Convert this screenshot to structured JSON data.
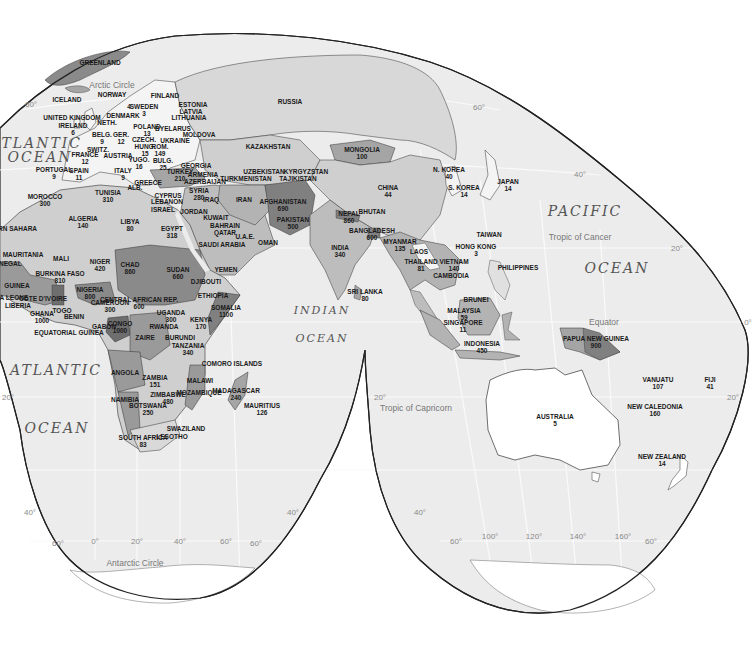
{
  "map": {
    "projection": "Interrupted equal-area (Eurasia/Africa/Oceania lobes)",
    "oceans": [
      {
        "id": "atlantic-n-1",
        "text": "ATLANTIC",
        "x": 36,
        "y": 143,
        "size": "big"
      },
      {
        "id": "atlantic-n-2",
        "text": "OCEAN",
        "x": 40,
        "y": 157,
        "size": "big"
      },
      {
        "id": "atlantic-s-1",
        "text": "ATLANTIC",
        "x": 56,
        "y": 370,
        "size": "big"
      },
      {
        "id": "atlantic-s-2",
        "text": "OCEAN",
        "x": 57,
        "y": 428,
        "size": "big"
      },
      {
        "id": "indian-1",
        "text": "INDIAN",
        "x": 322,
        "y": 310,
        "size": "med"
      },
      {
        "id": "indian-2",
        "text": "OCEAN",
        "x": 322,
        "y": 338,
        "size": "med"
      },
      {
        "id": "pacific-1",
        "text": "PACIFIC",
        "x": 585,
        "y": 211,
        "size": "big"
      },
      {
        "id": "pacific-2",
        "text": "OCEAN",
        "x": 617,
        "y": 268,
        "size": "big"
      }
    ],
    "reference_lines": [
      {
        "id": "arctic-circle",
        "text": "Arctic Circle",
        "x": 112,
        "y": 85
      },
      {
        "id": "tropic-cancer",
        "text": "Tropic of Cancer",
        "x": 580,
        "y": 237
      },
      {
        "id": "equator",
        "text": "Equator",
        "x": 604,
        "y": 322
      },
      {
        "id": "tropic-capricorn",
        "text": "Tropic of Capricorn",
        "x": 416,
        "y": 408
      },
      {
        "id": "antarctic-circle",
        "text": "Antarctic Circle",
        "x": 135,
        "y": 563
      }
    ],
    "graticule_labels": [
      {
        "text": "60°",
        "x": 31,
        "y": 104
      },
      {
        "text": "60°",
        "x": 479,
        "y": 107
      },
      {
        "text": "40°",
        "x": 580,
        "y": 174
      },
      {
        "text": "20°",
        "x": 677,
        "y": 248
      },
      {
        "text": "0°",
        "x": 748,
        "y": 322
      },
      {
        "text": "20°",
        "x": 733,
        "y": 397
      },
      {
        "text": "20°",
        "x": 8,
        "y": 397
      },
      {
        "text": "20°",
        "x": 380,
        "y": 397
      },
      {
        "text": "40°",
        "x": 30,
        "y": 512
      },
      {
        "text": "40°",
        "x": 293,
        "y": 512
      },
      {
        "text": "40°",
        "x": 420,
        "y": 512
      },
      {
        "text": "60°",
        "x": 58,
        "y": 543
      },
      {
        "text": "0°",
        "x": 95,
        "y": 541
      },
      {
        "text": "20°",
        "x": 137,
        "y": 541
      },
      {
        "text": "40°",
        "x": 180,
        "y": 541
      },
      {
        "text": "60°",
        "x": 226,
        "y": 541
      },
      {
        "text": "60°",
        "x": 256,
        "y": 543
      },
      {
        "text": "60°",
        "x": 456,
        "y": 541
      },
      {
        "text": "100°",
        "x": 490,
        "y": 536
      },
      {
        "text": "120°",
        "x": 534,
        "y": 536
      },
      {
        "text": "140°",
        "x": 578,
        "y": 536
      },
      {
        "text": "160°",
        "x": 623,
        "y": 536
      },
      {
        "text": "60°",
        "x": 651,
        "y": 541
      }
    ],
    "countries": [
      {
        "name": "GREENLAND",
        "value": "",
        "x": 100,
        "y": 62
      },
      {
        "name": "ICELAND",
        "value": "",
        "x": 67,
        "y": 99
      },
      {
        "name": "NORWAY",
        "value": "",
        "x": 112,
        "y": 94
      },
      {
        "name": "FINLAND",
        "value": "",
        "x": 165,
        "y": 95
      },
      {
        "name": "SWEDEN",
        "value": "3",
        "x": 144,
        "y": 110
      },
      {
        "name": "",
        "value": "4",
        "x": 129,
        "y": 103
      },
      {
        "name": "ESTONIA",
        "value": "",
        "x": 193,
        "y": 104
      },
      {
        "name": "LATVIA",
        "value": "",
        "x": 191,
        "y": 111
      },
      {
        "name": "LITHUANIA",
        "value": "",
        "x": 189,
        "y": 117
      },
      {
        "name": "UNITED KINGDOM",
        "value": "",
        "x": 72,
        "y": 117
      },
      {
        "name": "DENMARK",
        "value": "",
        "x": 123,
        "y": 115
      },
      {
        "name": "NETH.",
        "value": "",
        "x": 107,
        "y": 122
      },
      {
        "name": "IRELAND",
        "value": "6",
        "x": 73,
        "y": 129
      },
      {
        "name": "POLAND",
        "value": "13",
        "x": 147,
        "y": 130
      },
      {
        "name": "BYELARUS",
        "value": "",
        "x": 173,
        "y": 128
      },
      {
        "name": "MOLDOVA",
        "value": "",
        "x": 199,
        "y": 134
      },
      {
        "name": "BELG.",
        "value": "9",
        "x": 102,
        "y": 138
      },
      {
        "name": "GER.",
        "value": "12",
        "x": 121,
        "y": 138
      },
      {
        "name": "CZECH.",
        "value": "",
        "x": 144,
        "y": 139
      },
      {
        "name": "UKRAINE",
        "value": "",
        "x": 175,
        "y": 140
      },
      {
        "name": "SWITZ.",
        "value": "",
        "x": 98,
        "y": 149
      },
      {
        "name": "AUSTRIA",
        "value": "",
        "x": 118,
        "y": 155
      },
      {
        "name": "HUNG.",
        "value": "15",
        "x": 145,
        "y": 150
      },
      {
        "name": "ROM.",
        "value": "149",
        "x": 160,
        "y": 150
      },
      {
        "name": "FRANCE",
        "value": "12",
        "x": 85,
        "y": 158
      },
      {
        "name": "YUGO.",
        "value": "16",
        "x": 139,
        "y": 163
      },
      {
        "name": "BULG.",
        "value": "25",
        "x": 163,
        "y": 164
      },
      {
        "name": "GEORGIA",
        "value": "",
        "x": 196,
        "y": 165
      },
      {
        "name": "PORTUGAL",
        "value": "9",
        "x": 54,
        "y": 173
      },
      {
        "name": "SPAIN",
        "value": "11",
        "x": 79,
        "y": 174
      },
      {
        "name": "ITALY",
        "value": "9",
        "x": 123,
        "y": 174
      },
      {
        "name": "GREECE",
        "value": "",
        "x": 148,
        "y": 182
      },
      {
        "name": "ALB.",
        "value": "",
        "x": 135,
        "y": 187
      },
      {
        "name": "TURKEY",
        "value": "210",
        "x": 180,
        "y": 175
      },
      {
        "name": "ARMENIA",
        "value": "",
        "x": 203,
        "y": 174
      },
      {
        "name": "AZERBAIJAN",
        "value": "",
        "x": 205,
        "y": 181
      },
      {
        "name": "RUSSIA",
        "value": "",
        "x": 290,
        "y": 101
      },
      {
        "name": "KAZAKHSTAN",
        "value": "",
        "x": 268,
        "y": 146
      },
      {
        "name": "MONGOLIA",
        "value": "100",
        "x": 362,
        "y": 153
      },
      {
        "name": "UZBEKISTAN",
        "value": "",
        "x": 264,
        "y": 171
      },
      {
        "name": "TURKMENISTAN",
        "value": "",
        "x": 246,
        "y": 178
      },
      {
        "name": "KYRGYZSTAN",
        "value": "",
        "x": 306,
        "y": 171
      },
      {
        "name": "TAJIKISTAN",
        "value": "",
        "x": 298,
        "y": 178
      },
      {
        "name": "CHINA",
        "value": "44",
        "x": 388,
        "y": 191
      },
      {
        "name": "N. KOREA",
        "value": "40",
        "x": 449,
        "y": 173
      },
      {
        "name": "S. KOREA",
        "value": "14",
        "x": 464,
        "y": 191
      },
      {
        "name": "JAPAN",
        "value": "14",
        "x": 508,
        "y": 185
      },
      {
        "name": "CYPRUS",
        "value": "",
        "x": 168,
        "y": 195
      },
      {
        "name": "LEBANON",
        "value": "",
        "x": 167,
        "y": 201
      },
      {
        "name": "SYRIA",
        "value": "280",
        "x": 199,
        "y": 194
      },
      {
        "name": "ISRAEL",
        "value": "",
        "x": 163,
        "y": 209
      },
      {
        "name": "JORDAN",
        "value": "",
        "x": 194,
        "y": 211
      },
      {
        "name": "IRAQ",
        "value": "",
        "x": 211,
        "y": 199
      },
      {
        "name": "IRAN",
        "value": "",
        "x": 244,
        "y": 199
      },
      {
        "name": "AFGHANISTAN",
        "value": "690",
        "x": 283,
        "y": 205
      },
      {
        "name": "PAKISTAN",
        "value": "500",
        "x": 293,
        "y": 223
      },
      {
        "name": "KUWAIT",
        "value": "",
        "x": 216,
        "y": 217
      },
      {
        "name": "BAHRAIN",
        "value": "",
        "x": 225,
        "y": 225
      },
      {
        "name": "QATAR",
        "value": "",
        "x": 225,
        "y": 232
      },
      {
        "name": "U.A.E.",
        "value": "",
        "x": 245,
        "y": 236
      },
      {
        "name": "OMAN",
        "value": "",
        "x": 268,
        "y": 242
      },
      {
        "name": "SAUDI ARABIA",
        "value": "",
        "x": 222,
        "y": 244
      },
      {
        "name": "YEMEN",
        "value": "",
        "x": 226,
        "y": 269
      },
      {
        "name": "NEPAL",
        "value": "860",
        "x": 349,
        "y": 217
      },
      {
        "name": "BHUTAN",
        "value": "",
        "x": 372,
        "y": 211
      },
      {
        "name": "BANGLADESH",
        "value": "600",
        "x": 372,
        "y": 234
      },
      {
        "name": "INDIA",
        "value": "340",
        "x": 340,
        "y": 251
      },
      {
        "name": "SRI LANKA",
        "value": "80",
        "x": 365,
        "y": 295
      },
      {
        "name": "MYANMAR",
        "value": "135",
        "x": 400,
        "y": 245
      },
      {
        "name": "LAOS",
        "value": "",
        "x": 419,
        "y": 251
      },
      {
        "name": "THAILAND",
        "value": "81",
        "x": 421,
        "y": 265
      },
      {
        "name": "VIETNAM",
        "value": "140",
        "x": 454,
        "y": 265
      },
      {
        "name": "CAMBODIA",
        "value": "",
        "x": 451,
        "y": 275
      },
      {
        "name": "TAIWAN",
        "value": "",
        "x": 489,
        "y": 234
      },
      {
        "name": "HONG KONG",
        "value": "3",
        "x": 476,
        "y": 250
      },
      {
        "name": "PHILIPPINES",
        "value": "",
        "x": 518,
        "y": 267
      },
      {
        "name": "BRUNEI",
        "value": "",
        "x": 476,
        "y": 299
      },
      {
        "name": "MALAYSIA",
        "value": "59",
        "x": 464,
        "y": 314
      },
      {
        "name": "SINGAPORE",
        "value": "11",
        "x": 463,
        "y": 326
      },
      {
        "name": "INDONESIA",
        "value": "450",
        "x": 482,
        "y": 347
      },
      {
        "name": "PAPUA NEW GUINEA",
        "value": "900",
        "x": 596,
        "y": 342
      },
      {
        "name": "AUSTRALIA",
        "value": "5",
        "x": 555,
        "y": 420
      },
      {
        "name": "VANUATU",
        "value": "107",
        "x": 658,
        "y": 383
      },
      {
        "name": "FIJI",
        "value": "41",
        "x": 710,
        "y": 383
      },
      {
        "name": "NEW CALEDONIA",
        "value": "160",
        "x": 655,
        "y": 410
      },
      {
        "name": "NEW ZEALAND",
        "value": "14",
        "x": 662,
        "y": 460
      },
      {
        "name": "MOROCCO",
        "value": "300",
        "x": 45,
        "y": 200
      },
      {
        "name": "WESTERN SAHARA",
        "value": "",
        "x": 6,
        "y": 228
      },
      {
        "name": "TUNISIA",
        "value": "310",
        "x": 108,
        "y": 196
      },
      {
        "name": "ALGERIA",
        "value": "140",
        "x": 83,
        "y": 222
      },
      {
        "name": "LIBYA",
        "value": "80",
        "x": 130,
        "y": 225
      },
      {
        "name": "EGYPT",
        "value": "318",
        "x": 172,
        "y": 232
      },
      {
        "name": "MAURITANIA",
        "value": "",
        "x": 23,
        "y": 254
      },
      {
        "name": "MALI",
        "value": "",
        "x": 61,
        "y": 258
      },
      {
        "name": "NIGER",
        "value": "420",
        "x": 100,
        "y": 265
      },
      {
        "name": "CHAD",
        "value": "860",
        "x": 130,
        "y": 268
      },
      {
        "name": "SUDAN",
        "value": "660",
        "x": 178,
        "y": 273
      },
      {
        "name": "DJIBOUTI",
        "value": "",
        "x": 206,
        "y": 281
      },
      {
        "name": "ETHIOPIA",
        "value": "",
        "x": 213,
        "y": 295
      },
      {
        "name": "SOMALIA",
        "value": "1100",
        "x": 226,
        "y": 311
      },
      {
        "name": "SENEGAL",
        "value": "",
        "x": 6,
        "y": 263
      },
      {
        "name": "GUINEA",
        "value": "",
        "x": 17,
        "y": 285
      },
      {
        "name": "SIERRA LEONE",
        "value": "",
        "x": 4,
        "y": 297
      },
      {
        "name": "LIBERIA",
        "value": "",
        "x": 18,
        "y": 305
      },
      {
        "name": "BURKINA FASO",
        "value": "810",
        "x": 60,
        "y": 277
      },
      {
        "name": "COTE D'IVOIRE",
        "value": "",
        "x": 43,
        "y": 298
      },
      {
        "name": "NIGERIA",
        "value": "800",
        "x": 90,
        "y": 293
      },
      {
        "name": "GHANA",
        "value": "1000",
        "x": 42,
        "y": 317
      },
      {
        "name": "TOGO",
        "value": "",
        "x": 62,
        "y": 310
      },
      {
        "name": "BENIN",
        "value": "",
        "x": 74,
        "y": 316
      },
      {
        "name": "CENTRAL AFRICAN REP.",
        "value": "600",
        "x": 139,
        "y": 303
      },
      {
        "name": "CAMEROON",
        "value": "300",
        "x": 110,
        "y": 306
      },
      {
        "name": "EQUATORIAL GUINEA",
        "value": "",
        "x": 69,
        "y": 332
      },
      {
        "name": "GABON",
        "value": "",
        "x": 104,
        "y": 326
      },
      {
        "name": "CONGO",
        "value": "1000",
        "x": 120,
        "y": 327
      },
      {
        "name": "UGANDA",
        "value": "300",
        "x": 171,
        "y": 316
      },
      {
        "name": "KENYA",
        "value": "170",
        "x": 201,
        "y": 323
      },
      {
        "name": "RWANDA",
        "value": "",
        "x": 164,
        "y": 326
      },
      {
        "name": "BURUNDI",
        "value": "",
        "x": 180,
        "y": 337
      },
      {
        "name": "ZAIRE",
        "value": "",
        "x": 145,
        "y": 337
      },
      {
        "name": "TANZANIA",
        "value": "340",
        "x": 188,
        "y": 349
      },
      {
        "name": "COMORO ISLANDS",
        "value": "",
        "x": 232,
        "y": 363
      },
      {
        "name": "ANGOLA",
        "value": "",
        "x": 125,
        "y": 372
      },
      {
        "name": "ZAMBIA",
        "value": "151",
        "x": 155,
        "y": 381
      },
      {
        "name": "MALAWI",
        "value": "",
        "x": 200,
        "y": 380
      },
      {
        "name": "MOZAMBIQUE",
        "value": "",
        "x": 199,
        "y": 392
      },
      {
        "name": "MADAGASCAR",
        "value": "240",
        "x": 236,
        "y": 394
      },
      {
        "name": "NAMIBIA",
        "value": "",
        "x": 125,
        "y": 399
      },
      {
        "name": "ZIMBABWE",
        "value": "480",
        "x": 168,
        "y": 398
      },
      {
        "name": "BOTSWANA",
        "value": "250",
        "x": 148,
        "y": 409
      },
      {
        "name": "MAURITIUS",
        "value": "126",
        "x": 262,
        "y": 409
      },
      {
        "name": "SWAZILAND",
        "value": "",
        "x": 186,
        "y": 428
      },
      {
        "name": "LESOTHO",
        "value": "",
        "x": 172,
        "y": 436
      },
      {
        "name": "SOUTH AFRICA",
        "value": "83",
        "x": 143,
        "y": 441
      }
    ]
  },
  "colors": {
    "ocean": "#ececec",
    "ocean_grid": "#fafafa",
    "shade_0": "#ffffff",
    "shade_1": "#cfcfcf",
    "shade_2": "#b7b7b7",
    "shade_3": "#999999",
    "shade_4": "#808080",
    "border": "#3a3a3a",
    "outline": "#222222"
  }
}
